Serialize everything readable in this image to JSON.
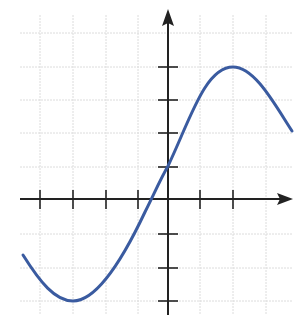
{
  "diagram": {
    "type": "function-graph",
    "colors": {
      "curve": "#3a5ba0",
      "axis": "#222222",
      "grid": "#d8d8d8",
      "background": "#ffffff"
    },
    "x_ticks": [
      -4,
      -3,
      -2,
      -1,
      1,
      2
    ],
    "y_ticks": [
      -3,
      -2,
      -1,
      1,
      2,
      3,
      4
    ],
    "key_points": {
      "minimum": [
        -3,
        -3
      ],
      "maximum": [
        2,
        4
      ],
      "y_intercept": [
        0,
        1
      ],
      "x_intercept": [
        -0.5,
        0
      ]
    },
    "curve_points": [
      [
        -4.4,
        -1.7
      ],
      [
        -3,
        -3
      ],
      [
        -1.5,
        -1.5
      ],
      [
        -0.5,
        0
      ],
      [
        0,
        1
      ],
      [
        1,
        2.8
      ],
      [
        2,
        4
      ],
      [
        3.8,
        2.1
      ]
    ]
  }
}
